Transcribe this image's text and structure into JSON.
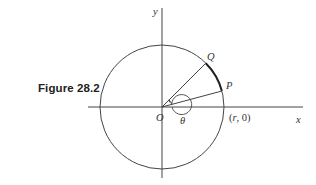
{
  "figure": {
    "caption": "Figure 28.2",
    "labels": {
      "y_axis": "y",
      "x_axis": "x",
      "origin": "O",
      "point_q": "Q",
      "point_p": "P",
      "angle": "θ",
      "point_r0_open": "(",
      "point_r0_r": "r",
      "point_r0_rest": ", 0)"
    },
    "colors": {
      "stroke": "#333333",
      "background": "#ffffff"
    }
  }
}
